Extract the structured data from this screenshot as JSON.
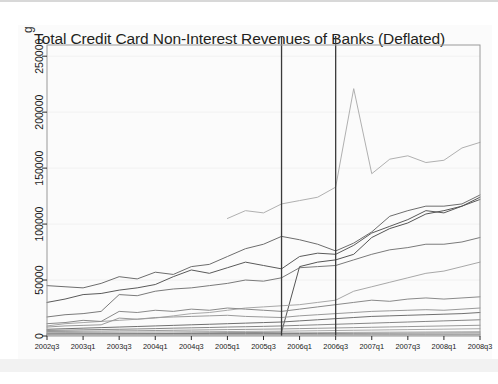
{
  "chart_data": {
    "type": "line",
    "title": "Total Credit Card Non-Interest Revenues of Banks (Deflated)",
    "xlabel": "",
    "ylabel": "",
    "ylim": [
      0,
      260000
    ],
    "yticks": [
      0,
      50000,
      100000,
      150000,
      200000,
      250000
    ],
    "ytick_labels": [
      "0",
      "50000",
      "100000",
      "150000",
      "200000",
      "250000"
    ],
    "grid": true,
    "legend": "none",
    "x": [
      "2002q3",
      "2002q4",
      "2003q1",
      "2003q2",
      "2003q3",
      "2003q4",
      "2004q1",
      "2004q2",
      "2004q3",
      "2004q4",
      "2005q1",
      "2005q2",
      "2005q3",
      "2005q4",
      "2006q1",
      "2006q2",
      "2006q3",
      "2006q4",
      "2007q1",
      "2007q2",
      "2007q3",
      "2007q4",
      "2008q1",
      "2008q2",
      "2008q3"
    ],
    "xtick_labels": [
      "2002q3",
      "2003q1",
      "2003q3",
      "2004q1",
      "2004q3",
      "2005q1",
      "2005q3",
      "2006q1",
      "2006q3",
      "2007q1",
      "2007q3",
      "2008q1",
      "2008q3"
    ],
    "xtick_indices": [
      0,
      2,
      4,
      6,
      8,
      10,
      12,
      14,
      16,
      18,
      20,
      22,
      24
    ],
    "vlines": [
      {
        "label": "2005q4",
        "x_index": 13
      },
      {
        "label": "2006q3",
        "x_index": 16
      }
    ],
    "annotations": [
      {
        "text": "spike peak",
        "x_index": 17,
        "value": 221000
      }
    ],
    "series": [
      {
        "name": "series-a-top",
        "color": "#b0b0b0",
        "start_index": 10,
        "values": [
          null,
          null,
          null,
          null,
          null,
          null,
          null,
          null,
          null,
          null,
          105000,
          112000,
          110000,
          118000,
          121000,
          124000,
          133000,
          221000,
          145000,
          158000,
          161000,
          155000,
          157000,
          168000,
          173000
        ]
      },
      {
        "name": "series-b",
        "color": "#6d6d6d",
        "values": [
          45000,
          44000,
          43000,
          47000,
          53000,
          51000,
          57000,
          55000,
          62000,
          64000,
          71000,
          78000,
          82000,
          89000,
          86000,
          82000,
          76000,
          83000,
          93000,
          107000,
          112000,
          116000,
          116000,
          118000,
          126000
        ]
      },
      {
        "name": "series-c",
        "color": "#5a5a5a",
        "values": [
          30000,
          33000,
          37000,
          38000,
          41000,
          43000,
          46000,
          53000,
          59000,
          56000,
          61000,
          66000,
          63000,
          60000,
          71000,
          74000,
          73000,
          81000,
          92000,
          98000,
          104000,
          112000,
          110000,
          116000,
          122000
        ]
      },
      {
        "name": "series-d",
        "color": "#7a7a7a",
        "values": [
          17000,
          19000,
          20000,
          22000,
          37000,
          36000,
          40000,
          42000,
          43000,
          45000,
          47000,
          50000,
          49000,
          52000,
          61000,
          62000,
          63000,
          68000,
          73000,
          77000,
          79000,
          82000,
          82000,
          84000,
          88000
        ]
      },
      {
        "name": "series-e-riser",
        "color": "#555555",
        "values": [
          1500,
          1600,
          1700,
          1800,
          1900,
          2000,
          2100,
          2300,
          2500,
          2700,
          2900,
          3000,
          3200,
          3400,
          62000,
          66000,
          68000,
          73000,
          88000,
          96000,
          101000,
          109000,
          112000,
          116000,
          124000
        ]
      },
      {
        "name": "series-f",
        "color": "#a8a8a8",
        "values": [
          9000,
          11000,
          12000,
          13000,
          14000,
          15000,
          16000,
          18000,
          20000,
          21000,
          23000,
          25000,
          26000,
          27000,
          28000,
          30000,
          32000,
          40000,
          44000,
          48000,
          52000,
          56000,
          58000,
          62000,
          66000
        ]
      },
      {
        "name": "series-g",
        "color": "#8a8a8a",
        "values": [
          11000,
          12000,
          14000,
          13000,
          22000,
          21000,
          23000,
          22000,
          24000,
          23000,
          25000,
          24000,
          23000,
          22000,
          24000,
          26000,
          28000,
          30000,
          32000,
          31000,
          33000,
          34000,
          33000,
          34000,
          35000
        ]
      },
      {
        "name": "series-h",
        "color": "#9a9a9a",
        "values": [
          8000,
          9000,
          9500,
          10000,
          16000,
          15000,
          16500,
          17000,
          17500,
          18000,
          18500,
          17500,
          17000,
          16500,
          18000,
          19000,
          20000,
          21000,
          22000,
          22500,
          23000,
          23500,
          23000,
          24000,
          25000
        ]
      },
      {
        "name": "series-i",
        "color": "#707070",
        "values": [
          6000,
          6500,
          7000,
          7500,
          8000,
          8500,
          9000,
          9500,
          10000,
          10500,
          11000,
          11500,
          12000,
          12500,
          13500,
          14500,
          15500,
          16500,
          17500,
          18000,
          18500,
          19000,
          19500,
          20000,
          21000
        ]
      },
      {
        "name": "series-j",
        "color": "#868686",
        "values": [
          5000,
          5200,
          5500,
          5800,
          6000,
          6300,
          6600,
          7000,
          7300,
          7600,
          8000,
          8300,
          8600,
          9000,
          9500,
          10000,
          10500,
          11000,
          11500,
          12000,
          12500,
          13000,
          13500,
          14000,
          14500
        ]
      },
      {
        "name": "series-k",
        "color": "#999999",
        "values": [
          4000,
          4100,
          4300,
          4400,
          4600,
          4700,
          4900,
          5100,
          5300,
          5500,
          5700,
          5900,
          6100,
          6300,
          6600,
          6900,
          7200,
          7500,
          7800,
          8100,
          8400,
          8700,
          9000,
          9300,
          9600
        ]
      },
      {
        "name": "series-l",
        "color": "#aaaaaa",
        "values": [
          3000,
          3100,
          3200,
          3300,
          3400,
          3500,
          3600,
          3700,
          3800,
          3900,
          4000,
          4100,
          4200,
          4300,
          4500,
          4700,
          4900,
          5100,
          5300,
          5500,
          5700,
          5900,
          6100,
          6300,
          6500
        ]
      },
      {
        "name": "series-m",
        "color": "#b4b4b4",
        "values": [
          2200,
          2250,
          2300,
          2350,
          2400,
          2450,
          2500,
          2550,
          2600,
          2650,
          2700,
          2750,
          2800,
          2850,
          2950,
          3050,
          3150,
          3250,
          3350,
          3450,
          3550,
          3650,
          3750,
          3850,
          3950
        ]
      },
      {
        "name": "series-n",
        "color": "#787878",
        "values": [
          1800,
          1820,
          1850,
          1880,
          1900,
          1930,
          1960,
          1990,
          2020,
          2050,
          2080,
          2110,
          2140,
          2170,
          2220,
          2270,
          2320,
          2370,
          2420,
          2470,
          2520,
          2570,
          2620,
          2670,
          2720
        ]
      },
      {
        "name": "series-o",
        "color": "#c0c0c0",
        "values": [
          1200,
          1210,
          1230,
          1250,
          1270,
          1290,
          1310,
          1330,
          1350,
          1370,
          1390,
          1410,
          1430,
          1450,
          1490,
          1530,
          1570,
          1610,
          1650,
          1690,
          1730,
          1770,
          1810,
          1850,
          1890
        ]
      },
      {
        "name": "series-p",
        "color": "#8f8f8f",
        "values": [
          800,
          810,
          820,
          830,
          840,
          850,
          860,
          870,
          880,
          890,
          900,
          910,
          920,
          930,
          950,
          970,
          990,
          1010,
          1030,
          1050,
          1070,
          1090,
          1110,
          1130,
          1150
        ]
      },
      {
        "name": "series-q",
        "color": "#c8c8c8",
        "values": [
          400,
          405,
          410,
          415,
          420,
          425,
          430,
          435,
          440,
          445,
          450,
          455,
          460,
          465,
          475,
          485,
          495,
          505,
          515,
          525,
          535,
          545,
          555,
          565,
          575
        ]
      }
    ]
  },
  "axes": {
    "x_axis_name": "quarter-axis",
    "y_axis_name": "revenue-axis"
  }
}
